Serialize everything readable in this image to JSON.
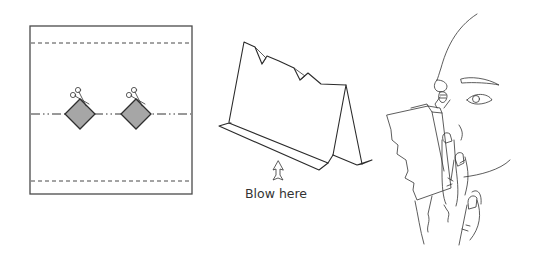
{
  "panels": [
    {
      "id": "step-1",
      "description": "Paper sheet with fold lines and two diamond cut-outs",
      "icons": [
        "fold-line-dashed",
        "fold-line-dash-dot",
        "diamond-cutout",
        "scissors-icon"
      ]
    },
    {
      "id": "step-2",
      "description": "Folded paper tent with notches",
      "icons": [
        "up-arrow-icon"
      ],
      "caption": "Blow here"
    },
    {
      "id": "step-3",
      "description": "Person holding folded paper to lips with fingers",
      "icons": [
        "face-profile",
        "hand"
      ]
    }
  ],
  "colors": {
    "line": "#2b2b2b",
    "diamond_fill": "#a6a6a6",
    "background": "#ffffff"
  }
}
